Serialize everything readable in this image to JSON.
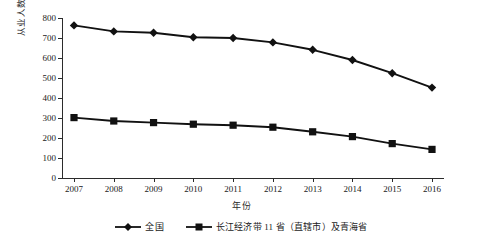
{
  "chart_data": {
    "type": "line",
    "title": "",
    "xlabel": "年份",
    "ylabel": "从业人数/万人",
    "categories": [
      "2007",
      "2008",
      "2009",
      "2010",
      "2011",
      "2012",
      "2013",
      "2014",
      "2015",
      "2016"
    ],
    "x": [
      2007,
      2008,
      2009,
      2010,
      2011,
      2012,
      2013,
      2014,
      2015,
      2016
    ],
    "ylim": [
      0,
      800
    ],
    "yticks": [
      0,
      100,
      200,
      300,
      400,
      500,
      600,
      700,
      800
    ],
    "ytick_labels": [
      "0",
      "100",
      "200",
      "300",
      "400",
      "500",
      "600",
      "700",
      "800"
    ],
    "grid": false,
    "legend_position": "bottom",
    "series": [
      {
        "name": "全国",
        "marker": "diamond",
        "color": "#111111",
        "values": [
          763,
          733,
          726,
          704,
          700,
          678,
          641,
          590,
          524,
          452
        ]
      },
      {
        "name": "长江经济带11省（直辖市）及青海省",
        "marker": "square",
        "color": "#111111",
        "values": [
          302,
          285,
          277,
          269,
          264,
          254,
          231,
          207,
          172,
          143
        ]
      }
    ]
  },
  "axes": {
    "y_title": "从业人数/万人",
    "x_title": "年份"
  },
  "legend": {
    "items": [
      {
        "label": "全国",
        "marker": "diamond-marker"
      },
      {
        "label": "长江经济带 11 省（直辖市）及青海省",
        "marker": "square-marker"
      }
    ]
  }
}
